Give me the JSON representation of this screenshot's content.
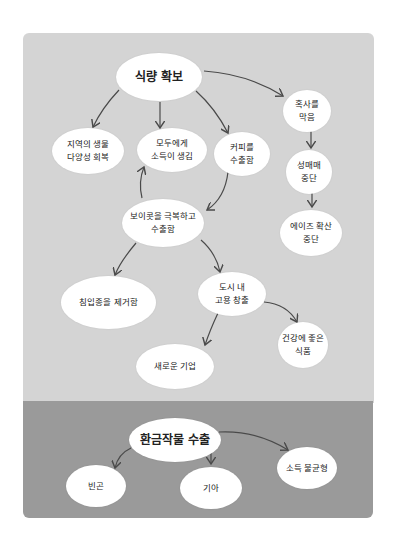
{
  "colors": {
    "top_panel": "#d4d4d4",
    "bottom_panel": "#9a9a9a",
    "node": "#ffffff",
    "arrow": "#4a4a4a"
  },
  "top": {
    "root": "식량 확보",
    "n_biodiversity": "지역의 생물\n다양성 회복",
    "n_income": "모두에게\n소득이 생김",
    "n_coffee": "커피를\n수출함",
    "n_prevent": "혹사를\n막음",
    "n_prostitution": "성매매\n중단",
    "n_aids": "에이즈 확산\n중단",
    "n_boycott": "보이콧을 극복하고\n수출함",
    "n_invasive": "침입종을 제거함",
    "n_jobs": "도시 내\n고용 창출",
    "n_company": "새로운 기업",
    "n_healthy": "건강에 좋은\n식품"
  },
  "bottom": {
    "root": "환금작물 수출",
    "n_poverty": "빈곤",
    "n_hunger": "기아",
    "n_inequality": "소득 불균형"
  }
}
